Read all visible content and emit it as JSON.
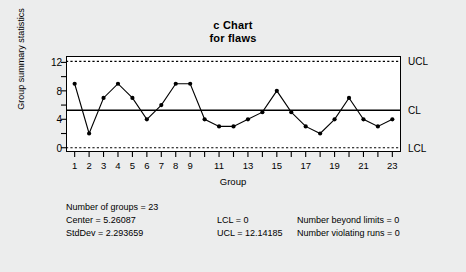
{
  "title": {
    "line1": "c Chart",
    "line2": "for flaws"
  },
  "axes": {
    "ylabel": "Group summary statistics",
    "xlabel": "Group"
  },
  "limit_labels": {
    "ucl": "UCL",
    "cl": "CL",
    "lcl": "LCL"
  },
  "stats": {
    "num_groups": "Number of groups = 23",
    "center": "Center = 5.26087",
    "stddev": "StdDev = 2.293659",
    "lcl": "LCL = 0",
    "ucl": "UCL = 12.14185",
    "beyond": "Number beyond limits = 0",
    "violating": "Number violating runs = 0"
  },
  "colors": {
    "background": "#eceded",
    "plot_background": "#ffffff",
    "line": "#000000",
    "point": "#000000",
    "frame": "#000000"
  },
  "chart_data": {
    "type": "line",
    "title": "c Chart for flaws",
    "xlabel": "Group",
    "ylabel": "Group summary statistics",
    "x": [
      1,
      2,
      3,
      4,
      5,
      6,
      7,
      8,
      9,
      10,
      11,
      12,
      13,
      14,
      15,
      16,
      17,
      18,
      19,
      20,
      21,
      22,
      23
    ],
    "values": [
      9,
      2,
      7,
      9,
      7,
      4,
      6,
      9,
      9,
      4,
      3,
      3,
      4,
      5,
      8,
      5,
      3,
      2,
      4,
      7,
      4,
      3,
      4
    ],
    "xtick_values": [
      1,
      2,
      3,
      4,
      5,
      6,
      7,
      8,
      9,
      10,
      11,
      12,
      13,
      14,
      15,
      16,
      17,
      18,
      19,
      20,
      21,
      22,
      23
    ],
    "xtick_labels": [
      "1",
      "2",
      "3",
      "4",
      "5",
      "6",
      "7",
      "8",
      "9",
      "",
      "11",
      "",
      "13",
      "",
      "15",
      "",
      "17",
      "",
      "19",
      "",
      "21",
      "",
      "23"
    ],
    "ytick_values": [
      0,
      2,
      4,
      6,
      8,
      10,
      12
    ],
    "ytick_labels": [
      "0",
      "",
      "4",
      "",
      "8",
      "",
      "12"
    ],
    "ylim": [
      -0.6,
      12.9
    ],
    "xlim": [
      0.4,
      23.6
    ],
    "center_line": 5.26087,
    "ucl": 12.14185,
    "lcl": 0,
    "center_line_style": "solid",
    "limit_line_style": "dashed",
    "grid": false,
    "legend": "none",
    "marker": "filled-circle",
    "num_groups": 23,
    "stddev": 2.293659,
    "beyond_limits": 0,
    "violating_runs": 0
  }
}
